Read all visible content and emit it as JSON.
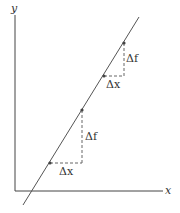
{
  "diagram": {
    "axes": {
      "x_label": "x",
      "y_label": "y"
    },
    "annotations": {
      "lower": {
        "dx_label": "Δx",
        "df_label": "Δf"
      },
      "upper": {
        "dx_label": "Δx",
        "df_label": "Δf"
      }
    },
    "colors": {
      "line": "#555555",
      "axis": "#444444",
      "dash": "#666666",
      "point": "#444444"
    }
  }
}
